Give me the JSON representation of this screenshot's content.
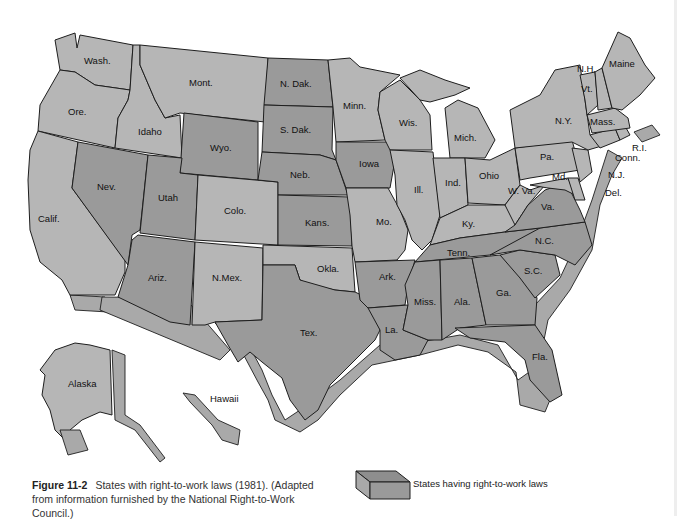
{
  "figure": {
    "label": "Figure 11-2",
    "caption": "States with right-to-work laws (1981).  (Adapted from information furnished by the National Right-to-Work Council.)"
  },
  "legend": {
    "label": "States having right-to-work laws",
    "color": "#999999"
  },
  "colors": {
    "right_to_work": "#9a9a9a",
    "other": "#b6b6b6",
    "coast_side": "#a9a9a9",
    "border": "#1e1e1e"
  },
  "states": [
    {
      "name": "Wash.",
      "rtw": false
    },
    {
      "name": "Ore.",
      "rtw": false
    },
    {
      "name": "Calif.",
      "rtw": false
    },
    {
      "name": "Idaho",
      "rtw": false
    },
    {
      "name": "Nev.",
      "rtw": true
    },
    {
      "name": "Mont.",
      "rtw": false
    },
    {
      "name": "Wyo.",
      "rtw": true
    },
    {
      "name": "Utah",
      "rtw": true
    },
    {
      "name": "Ariz.",
      "rtw": true
    },
    {
      "name": "Colo.",
      "rtw": false
    },
    {
      "name": "N.Mex.",
      "rtw": false
    },
    {
      "name": "N. Dak.",
      "rtw": true
    },
    {
      "name": "S. Dak.",
      "rtw": true
    },
    {
      "name": "Neb.",
      "rtw": true
    },
    {
      "name": "Kans.",
      "rtw": true
    },
    {
      "name": "Okla.",
      "rtw": false
    },
    {
      "name": "Tex.",
      "rtw": true
    },
    {
      "name": "Minn.",
      "rtw": false
    },
    {
      "name": "Iowa",
      "rtw": true
    },
    {
      "name": "Mo.",
      "rtw": false
    },
    {
      "name": "Ark.",
      "rtw": true
    },
    {
      "name": "La.",
      "rtw": true
    },
    {
      "name": "Wis.",
      "rtw": false
    },
    {
      "name": "Ill.",
      "rtw": false
    },
    {
      "name": "Mich.",
      "rtw": false
    },
    {
      "name": "Ind.",
      "rtw": false
    },
    {
      "name": "Ohio",
      "rtw": false
    },
    {
      "name": "Ky.",
      "rtw": false
    },
    {
      "name": "Tenn.",
      "rtw": true
    },
    {
      "name": "Miss.",
      "rtw": true
    },
    {
      "name": "Ala.",
      "rtw": true
    },
    {
      "name": "Ga.",
      "rtw": true
    },
    {
      "name": "Fla.",
      "rtw": true
    },
    {
      "name": "S.C.",
      "rtw": true
    },
    {
      "name": "N.C.",
      "rtw": true
    },
    {
      "name": "Va.",
      "rtw": true
    },
    {
      "name": "W. Va.",
      "rtw": false
    },
    {
      "name": "Md.",
      "rtw": false
    },
    {
      "name": "Del.",
      "rtw": false
    },
    {
      "name": "Pa.",
      "rtw": false
    },
    {
      "name": "N.J.",
      "rtw": false
    },
    {
      "name": "N.Y.",
      "rtw": false
    },
    {
      "name": "Conn.",
      "rtw": false
    },
    {
      "name": "R.I.",
      "rtw": false
    },
    {
      "name": "Mass.",
      "rtw": false
    },
    {
      "name": "Vt.",
      "rtw": false
    },
    {
      "name": "N.H.",
      "rtw": false
    },
    {
      "name": "Maine",
      "rtw": false
    },
    {
      "name": "Alaska",
      "rtw": false
    },
    {
      "name": "Hawaii",
      "rtw": false
    }
  ],
  "labels": {
    "wash": "Wash.",
    "ore": "Ore.",
    "calif": "Calif.",
    "idaho": "Idaho",
    "nev": "Nev.",
    "mont": "Mont.",
    "wyo": "Wyo.",
    "utah": "Utah",
    "ariz": "Ariz.",
    "colo": "Colo.",
    "nmex": "N.Mex.",
    "ndak": "N. Dak.",
    "sdak": "S. Dak.",
    "neb": "Neb.",
    "kans": "Kans.",
    "okla": "Okla.",
    "tex": "Tex.",
    "minn": "Minn.",
    "iowa": "Iowa",
    "mo": "Mo.",
    "ark": "Ark.",
    "la": "La.",
    "wis": "Wis.",
    "ill": "Ill.",
    "mich": "Mich.",
    "ind": "Ind.",
    "ohio": "Ohio",
    "ky": "Ky.",
    "tenn": "Tenn.",
    "miss": "Miss.",
    "ala": "Ala.",
    "ga": "Ga.",
    "fla": "Fla.",
    "sc": "S.C.",
    "nc": "N.C.",
    "va": "Va.",
    "wva": "W. Va.",
    "md": "Md.",
    "del": "Del.",
    "pa": "Pa.",
    "nj": "N.J.",
    "ny": "N.Y.",
    "conn": "Conn.",
    "ri": "R.I.",
    "mass": "Mass.",
    "vt": "Vt.",
    "nh": "N.H.",
    "maine": "Maine",
    "alaska": "Alaska",
    "hawaii": "Hawaii"
  }
}
